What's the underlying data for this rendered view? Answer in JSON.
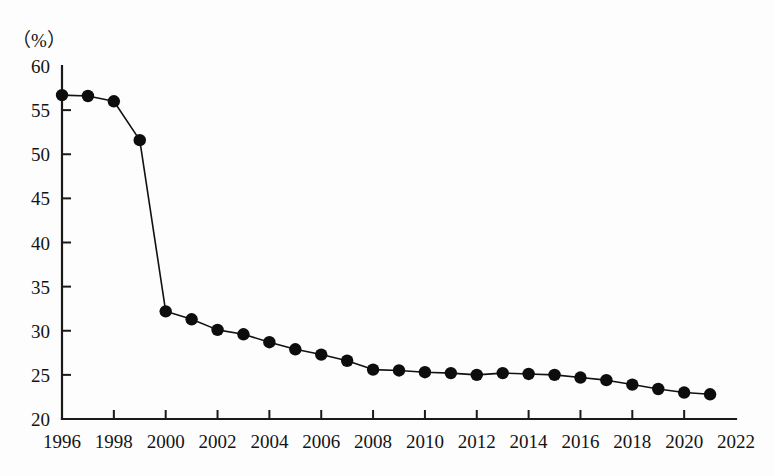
{
  "chart_data": {
    "type": "line",
    "title": "",
    "subtitle": "",
    "xlabel": "",
    "ylabel": "（%）",
    "unit_label": "（%）",
    "xlim": [
      1996,
      2022
    ],
    "ylim": [
      20,
      60
    ],
    "ytick_step": 5,
    "xtick_step": 2,
    "grid": false,
    "legend": "none",
    "marker": "filled-circle",
    "line_color": "#111111",
    "marker_color": "#0d0d0d",
    "background_color": "#fdfdfd",
    "yticks": [
      20,
      25,
      30,
      35,
      40,
      45,
      50,
      55,
      60
    ],
    "ytick_labels": [
      "20",
      "25",
      "30",
      "35",
      "40",
      "45",
      "50",
      "55",
      "60"
    ],
    "xticks": [
      1996,
      1998,
      2000,
      2002,
      2004,
      2006,
      2008,
      2010,
      2012,
      2014,
      2016,
      2018,
      2020,
      2022
    ],
    "xtick_labels": [
      "1996",
      "1998",
      "2000",
      "2002",
      "2004",
      "2006",
      "2008",
      "2010",
      "2012",
      "2014",
      "2016",
      "2018",
      "2020",
      "2022"
    ],
    "x": [
      1996,
      1997,
      1998,
      1999,
      2000,
      2001,
      2002,
      2003,
      2004,
      2005,
      2006,
      2007,
      2008,
      2009,
      2010,
      2011,
      2012,
      2013,
      2014,
      2015,
      2016,
      2017,
      2018,
      2019,
      2020,
      2021
    ],
    "values": [
      56.7,
      56.6,
      56.0,
      51.6,
      32.2,
      31.3,
      30.1,
      29.6,
      28.7,
      27.9,
      27.3,
      26.6,
      25.6,
      25.5,
      25.3,
      25.2,
      25.0,
      25.2,
      25.1,
      25.0,
      24.7,
      24.4,
      23.9,
      23.4,
      23.0,
      22.8
    ],
    "series": [
      {
        "name": "series-1",
        "values": [
          56.7,
          56.6,
          56.0,
          51.6,
          32.2,
          31.3,
          30.1,
          29.6,
          28.7,
          27.9,
          27.3,
          26.6,
          25.6,
          25.5,
          25.3,
          25.2,
          25.0,
          25.2,
          25.1,
          25.0,
          24.7,
          24.4,
          23.9,
          23.4,
          23.0,
          22.8
        ]
      }
    ]
  }
}
